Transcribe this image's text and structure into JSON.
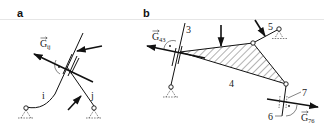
{
  "figure": {
    "header_rule_color": "#e6e6e6",
    "ink_color": "#111111",
    "panels": [
      {
        "id": "a",
        "label": "a",
        "force_label": "G",
        "force_subscript": "ij",
        "links": [
          {
            "label": "i"
          },
          {
            "label": "j"
          }
        ],
        "marks": [
          "right-angle",
          "dot"
        ]
      },
      {
        "id": "b",
        "label": "b",
        "force_label_left": "G",
        "force_subscript_left": "43",
        "force_label_right": "G",
        "force_subscript_right": "76",
        "parts": [
          {
            "label": "3"
          },
          {
            "label": "4"
          },
          {
            "label": "5"
          },
          {
            "label": "6"
          },
          {
            "label": "7"
          }
        ]
      }
    ]
  }
}
